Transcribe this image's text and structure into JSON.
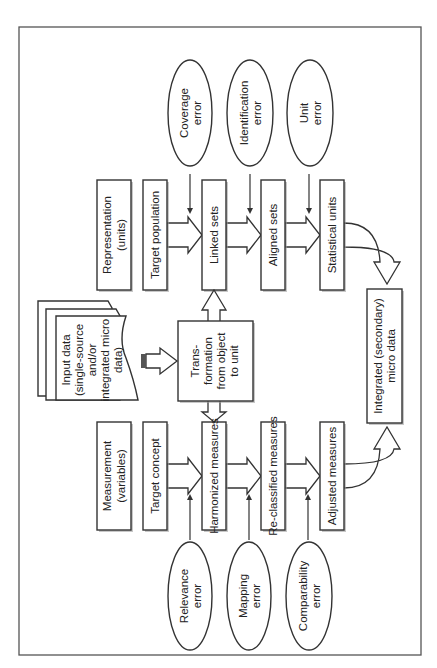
{
  "diagram": {
    "orientation": "rotated-90-counterclockwise",
    "representation_track": {
      "header": "Representation (units)",
      "steps": [
        "Target population",
        "Linked sets",
        "Aligned sets",
        "Statistical units"
      ],
      "errors": [
        "Coverage error",
        "Identification error",
        "Unit error"
      ]
    },
    "measurement_track": {
      "header": "Measurement (variables)",
      "steps": [
        "Target concept",
        "Harmonized measures",
        "Re-classified measures",
        "Adjusted measures"
      ],
      "errors": [
        "Relevance error",
        "Mapping error",
        "Comparability error"
      ]
    },
    "input": {
      "line1": "Input data",
      "line2": "(single-source",
      "line3": "and/or",
      "line4": "integrated micro",
      "line5": "data)"
    },
    "transformation": {
      "line1": "Trans-",
      "line2": "formation",
      "line3": "from object",
      "line4": "to unit"
    },
    "output": {
      "line1": "Integrated (secondary)",
      "line2": "micro data"
    },
    "labels": {
      "rep_h1": "Representation",
      "rep_h2": "(units)",
      "meas_h1": "Measurement",
      "meas_h2": "(variables)",
      "cov1": "Coverage",
      "cov2": "error",
      "ident1": "Identification",
      "ident2": "error",
      "unit1": "Unit",
      "unit2": "error",
      "rel1": "Relevance",
      "rel2": "error",
      "map1": "Mapping",
      "map2": "error",
      "comp1": "Comparability",
      "comp2": "error"
    }
  }
}
